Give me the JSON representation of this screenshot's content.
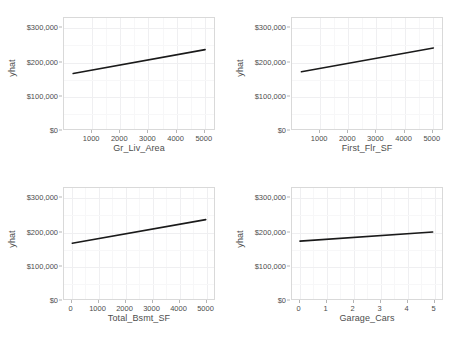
{
  "figure": {
    "background_color": "#ffffff",
    "panel_background_color": "#ffffff",
    "panel_border_color": "#d9d9d9",
    "gridline_color": "#efeff1",
    "line_color": "#1a1a1a",
    "text_color": "#4d4d4d",
    "width": 456,
    "height": 341
  },
  "chart_data": [
    {
      "type": "line",
      "title": "",
      "xlabel": "Gr_Liv_Area",
      "ylabel": "yhat",
      "xlim": [
        0,
        5400
      ],
      "ylim": [
        0,
        330000
      ],
      "xticks": [
        1000,
        2000,
        3000,
        4000,
        5000
      ],
      "xticklabels": [
        "1000",
        "2000",
        "3000",
        "4000",
        "5000"
      ],
      "yticks": [
        0,
        100000,
        200000,
        300000
      ],
      "yticklabels": [
        "$0",
        "$100,000",
        "$200,000",
        "$300,000"
      ],
      "grid": true,
      "legend": "none",
      "series": [
        {
          "name": "yhat",
          "x": [
            330,
            5080
          ],
          "values": [
            165000,
            236000
          ]
        }
      ]
    },
    {
      "type": "line",
      "title": "",
      "xlabel": "First_Flr_SF",
      "ylabel": "yhat",
      "xlim": [
        0,
        5400
      ],
      "ylim": [
        0,
        330000
      ],
      "xticks": [
        1000,
        2000,
        3000,
        4000,
        5000
      ],
      "xticklabels": [
        "1000",
        "2000",
        "3000",
        "4000",
        "5000"
      ],
      "yticks": [
        0,
        100000,
        200000,
        300000
      ],
      "yticklabels": [
        "$0",
        "$100,000",
        "$200,000",
        "$300,000"
      ],
      "grid": true,
      "legend": "none",
      "series": [
        {
          "name": "yhat",
          "x": [
            340,
            5090
          ],
          "values": [
            170000,
            241000
          ]
        }
      ]
    },
    {
      "type": "line",
      "title": "",
      "xlabel": "Total_Bsmt_SF",
      "ylabel": "yhat",
      "xlim": [
        -280,
        5350
      ],
      "ylim": [
        0,
        330000
      ],
      "xticks": [
        0,
        1000,
        2000,
        3000,
        4000,
        5000
      ],
      "xticklabels": [
        "0",
        "1000",
        "2000",
        "3000",
        "4000",
        "5000"
      ],
      "yticks": [
        0,
        100000,
        200000,
        300000
      ],
      "yticklabels": [
        "$0",
        "$100,000",
        "$200,000",
        "$300,000"
      ],
      "grid": true,
      "legend": "none",
      "series": [
        {
          "name": "yhat",
          "x": [
            30,
            5040
          ],
          "values": [
            166000,
            236000
          ]
        }
      ]
    },
    {
      "type": "line",
      "title": "",
      "xlabel": "Garage_Cars",
      "ylabel": "yhat",
      "xlim": [
        -0.28,
        5.35
      ],
      "ylim": [
        0,
        330000
      ],
      "xticks": [
        0,
        1,
        2,
        3,
        4,
        5
      ],
      "xticklabels": [
        "0",
        "1",
        "2",
        "3",
        "4",
        "5"
      ],
      "yticks": [
        0,
        100000,
        200000,
        300000
      ],
      "yticklabels": [
        "$0",
        "$100,000",
        "$200,000",
        "$300,000"
      ],
      "grid": true,
      "legend": "none",
      "series": [
        {
          "name": "yhat",
          "x": [
            0.02,
            5.0
          ],
          "values": [
            172000,
            199000
          ]
        }
      ]
    }
  ]
}
